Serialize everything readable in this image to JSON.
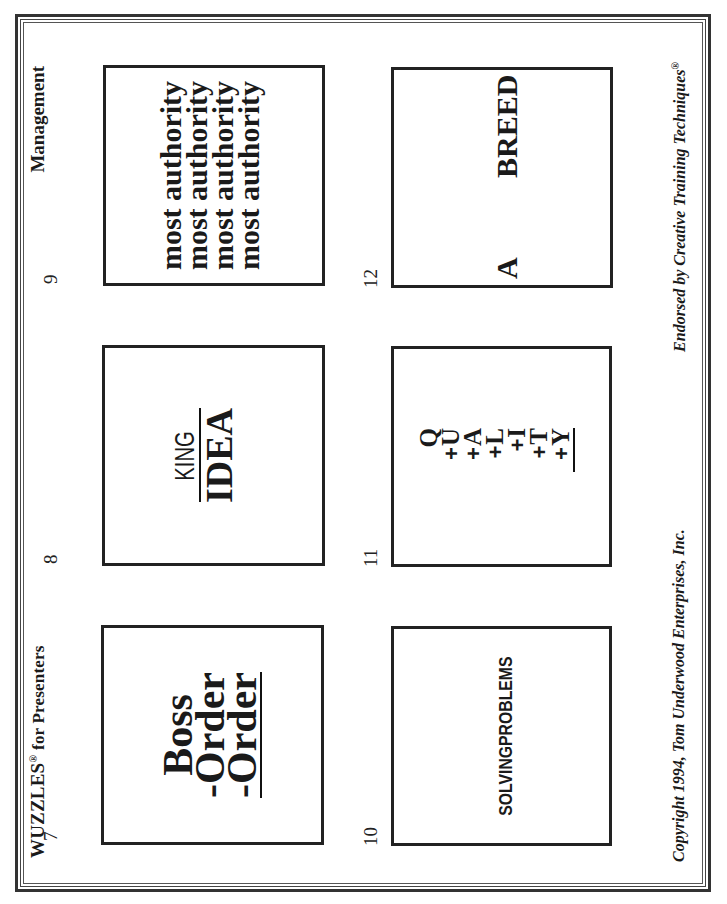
{
  "header": {
    "title_brand": "WUZZLES",
    "title_reg_mark": "®",
    "title_rest": "for Presenters",
    "category": "Management"
  },
  "footer": {
    "copyright": "Copyright 1994, Tom Underwood Enterprises, Inc.",
    "endorsement": "Endorsed by Creative Training Techniques",
    "endorsement_mark": "®"
  },
  "puzzles": [
    {
      "number": "7",
      "lines": [
        "Boss",
        "-Order",
        "-Order"
      ]
    },
    {
      "number": "8",
      "numerator": "KING",
      "denominator": "IDEA"
    },
    {
      "number": "9",
      "lines": [
        "most authority",
        "most authority",
        "most authority",
        "most authority"
      ]
    },
    {
      "number": "10",
      "text": "SOLVINGPROBLEMS"
    },
    {
      "number": "11",
      "rows": [
        {
          "op": "",
          "letter": "Q"
        },
        {
          "op": "+",
          "letter": "U"
        },
        {
          "op": "+",
          "letter": "A"
        },
        {
          "op": "+",
          "letter": "L"
        },
        {
          "op": "+",
          "letter": "I"
        },
        {
          "op": "+",
          "letter": "T"
        },
        {
          "op": "+",
          "letter": "Y"
        }
      ]
    },
    {
      "number": "12",
      "left_text": "A",
      "right_text": "BREED"
    }
  ],
  "colors": {
    "ink": "#1a1a1a",
    "paper": "#ffffff"
  }
}
